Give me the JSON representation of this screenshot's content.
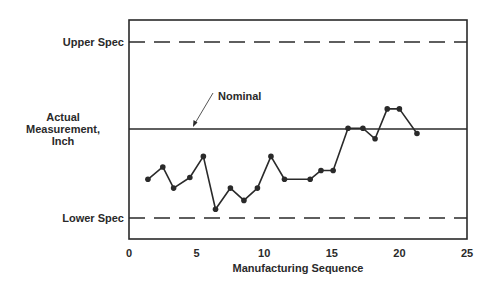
{
  "chart_data": {
    "type": "line",
    "title": "",
    "xlabel": "Manufacturing Sequence",
    "ylabel": "Actual Measurement, Inch",
    "ylabel_lines": [
      "Actual",
      "Measurement,",
      "Inch"
    ],
    "xlim": [
      0,
      25
    ],
    "xticks": [
      0,
      5,
      10,
      15,
      20,
      25
    ],
    "ylim_note": "relative scale: Lower Spec = 0, Upper Spec = 1",
    "ylim": [
      -0.12,
      1.12
    ],
    "grid": false,
    "reference_lines": [
      {
        "name": "Upper Spec",
        "label": "Upper Spec",
        "y": 1.0,
        "style": "dashed"
      },
      {
        "name": "Nominal",
        "label": "Nominal",
        "y": 0.506,
        "style": "solid",
        "annotation": "arrow"
      },
      {
        "name": "Lower Spec",
        "label": "Lower Spec",
        "y": 0.0,
        "style": "dashed"
      }
    ],
    "series": [
      {
        "name": "Actual Measurement",
        "marker": "circle",
        "x": [
          1.4,
          2.5,
          3.3,
          4.5,
          5.5,
          6.4,
          7.5,
          8.5,
          9.5,
          10.5,
          11.5,
          13.4,
          14.2,
          15.1,
          16.2,
          17.3,
          18.2,
          19.1,
          20.0,
          21.3
        ],
        "values": [
          0.22,
          0.29,
          0.17,
          0.23,
          0.35,
          0.05,
          0.17,
          0.1,
          0.17,
          0.35,
          0.22,
          0.22,
          0.27,
          0.27,
          0.51,
          0.51,
          0.45,
          0.62,
          0.62,
          0.48
        ]
      }
    ]
  },
  "labels": {
    "upper_spec": "Upper Spec",
    "lower_spec": "Lower Spec",
    "nominal": "Nominal",
    "xlabel": "Manufacturing Sequence",
    "ylabel_line1": "Actual",
    "ylabel_line2": "Measurement,",
    "ylabel_line3": "Inch"
  },
  "colors": {
    "ink": "#2a2a2a",
    "background": "#ffffff"
  }
}
